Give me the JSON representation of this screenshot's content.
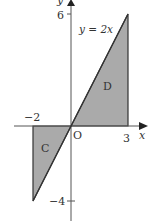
{
  "diagram": {
    "type": "coordinate-graph",
    "axes": {
      "x_label": "x",
      "y_label": "y",
      "origin_label": "O"
    },
    "ticks": {
      "x_pos": "3",
      "x_neg": "−2",
      "y_pos": "6",
      "y_neg": "−4"
    },
    "line": {
      "equation": "y = 2x"
    },
    "regions": [
      {
        "name": "D",
        "vertices": [
          [
            0,
            0
          ],
          [
            3,
            6
          ],
          [
            3,
            0
          ]
        ]
      },
      {
        "name": "C",
        "vertices": [
          [
            0,
            0
          ],
          [
            -2,
            -4
          ],
          [
            -2,
            0
          ]
        ]
      }
    ],
    "colors": {
      "shade": "#aaaaaa",
      "line": "#333333",
      "axis": "#555555"
    }
  }
}
